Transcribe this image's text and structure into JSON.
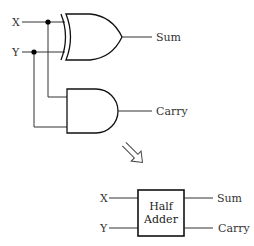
{
  "circuit": {
    "inputs": [
      {
        "id": "x",
        "label": "X"
      },
      {
        "id": "y",
        "label": "Y"
      }
    ],
    "gates": [
      {
        "id": "xor",
        "type": "XOR",
        "output_label": "Sum"
      },
      {
        "id": "and",
        "type": "AND",
        "output_label": "Carry"
      }
    ]
  },
  "transform_arrow": {
    "icon": "hollow-arrow-down-right-icon"
  },
  "block": {
    "title_line1": "Half",
    "title_line2": "Adder",
    "inputs": [
      "X",
      "Y"
    ],
    "outputs": [
      "Sum",
      "Carry"
    ]
  }
}
